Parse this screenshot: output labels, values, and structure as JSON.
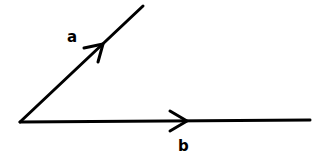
{
  "diagram": {
    "type": "vectors",
    "origin": [
      20,
      122
    ],
    "vectors": [
      {
        "label": "a",
        "start": [
          20,
          122
        ],
        "end": [
          143,
          6
        ],
        "arrow_at": [
          103,
          44
        ]
      },
      {
        "label": "b",
        "start": [
          20,
          122
        ],
        "end": [
          310,
          120
        ],
        "arrow_at": [
          187,
          121
        ]
      }
    ],
    "color": "#000000"
  }
}
